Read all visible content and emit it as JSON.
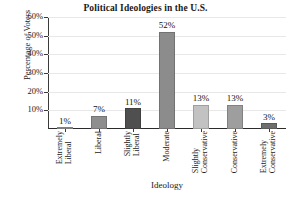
{
  "chart_data": {
    "type": "bar",
    "title": "Political Ideologies in the U.S.",
    "xlabel": "Ideology",
    "ylabel": "Percentage of Voters",
    "categories": [
      "Extremely Liberal",
      "Liberal",
      "Slightly Liberal",
      "Moderate",
      "Slightly Conservative",
      "Conservative",
      "Extremely Conservative"
    ],
    "category_lines": [
      [
        "Extremely",
        "Liberal"
      ],
      [
        "Liberal"
      ],
      [
        "Slightly",
        "Liberal"
      ],
      [
        "Moderate"
      ],
      [
        "Slightly",
        "Conservative"
      ],
      [
        "Conservative"
      ],
      [
        "Extremely",
        "Conservative"
      ]
    ],
    "values": [
      1,
      7,
      11,
      52,
      13,
      13,
      3
    ],
    "value_labels": [
      "1%",
      "7%",
      "11%",
      "52%",
      "13%",
      "13%",
      "3%"
    ],
    "bar_colors": [
      "#9a9a9a",
      "#8e8e8e",
      "#4f4f4f",
      "#8c8c8c",
      "#c2c2c2",
      "#9e9e9e",
      "#6e6e6e"
    ],
    "ylim": [
      0,
      60
    ],
    "yticks": [
      10,
      20,
      30,
      40,
      50,
      60
    ],
    "ytick_labels": [
      "10%",
      "20%",
      "30%",
      "40%",
      "50%",
      "60%"
    ],
    "grid": true,
    "grid_color": "#e8e8e8",
    "legend": null,
    "axis_color": "#2b2b2b",
    "background": "#ffffff"
  }
}
